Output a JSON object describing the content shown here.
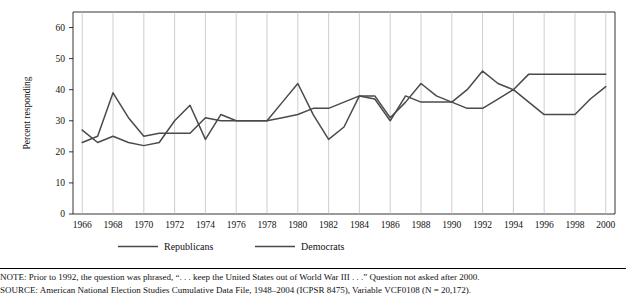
{
  "chart_data": {
    "type": "line",
    "title": "",
    "xlabel": "",
    "ylabel": "Percent responding",
    "ylim": [
      0,
      65
    ],
    "yticks": [
      0,
      10,
      20,
      30,
      40,
      50,
      60
    ],
    "xticks": [
      1966,
      1968,
      1970,
      1972,
      1974,
      1976,
      1978,
      1980,
      1982,
      1984,
      1986,
      1988,
      1990,
      1992,
      1994,
      1996,
      1998,
      2000
    ],
    "x": [
      1966,
      1967,
      1968,
      1969,
      1970,
      1971,
      1972,
      1973,
      1974,
      1975,
      1976,
      1977,
      1978,
      1979,
      1980,
      1981,
      1982,
      1983,
      1984,
      1985,
      1986,
      1987,
      1988,
      1989,
      1990,
      1991,
      1992,
      1993,
      1994,
      1995,
      1996,
      1997,
      1998,
      1999,
      2000
    ],
    "grid": "vertical",
    "legend_position": "bottom",
    "series": [
      {
        "name": "Republicans",
        "color": "#4a4a4a",
        "values": [
          27,
          23,
          25,
          23,
          22,
          23,
          30,
          35,
          24,
          32,
          30,
          30,
          30,
          36,
          42,
          32,
          24,
          28,
          38,
          38,
          31,
          36,
          42,
          38,
          36,
          40,
          46,
          42,
          40,
          45,
          45,
          45,
          45,
          45,
          45
        ]
      },
      {
        "name": "Democrats",
        "color": "#4a4a4a",
        "values": [
          23,
          25,
          39,
          31,
          25,
          26,
          26,
          26,
          31,
          30,
          30,
          30,
          30,
          31,
          32,
          34,
          34,
          36,
          38,
          37,
          30,
          38,
          36,
          36,
          36,
          34,
          34,
          37,
          40,
          36,
          32,
          32,
          32,
          37,
          41
        ]
      }
    ],
    "legend": [
      {
        "label": "Republicans",
        "dash": "solid"
      },
      {
        "label": "Democrats",
        "dash": "solid"
      }
    ]
  },
  "notes": {
    "line1": "NOTE: Prior to 1992, the question was phrased, “. . . keep the United States out of World War III . . .” Question not asked after 2000.",
    "line2": "SOURCE: American National Election Studies Cumulative Data File, 1948–2004 (ICPSR 8475), Variable VCF0108 (N = 20,172)."
  }
}
